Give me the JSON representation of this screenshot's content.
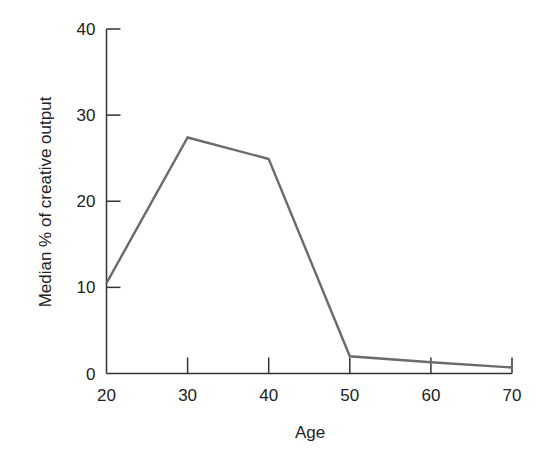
{
  "chart_data": {
    "type": "line",
    "title": "",
    "xlabel": "Age",
    "ylabel": "Median % of creative output",
    "x": [
      20,
      30,
      40,
      50,
      60,
      70
    ],
    "series": [
      {
        "name": "Median % of creative output",
        "values": [
          10.5,
          27.4,
          24.9,
          2.0,
          1.3,
          0.7
        ]
      }
    ],
    "xlim": [
      20,
      70
    ],
    "ylim": [
      0,
      40
    ],
    "xticks": [
      20,
      30,
      40,
      50,
      60,
      70
    ],
    "yticks": [
      0,
      10,
      20,
      30,
      40
    ],
    "grid": false,
    "legend": "none",
    "colors": {
      "line": "#6b6b6b",
      "axis": "#333333"
    }
  }
}
